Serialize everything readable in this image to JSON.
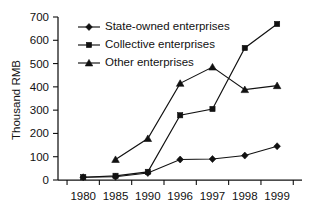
{
  "chart_data": {
    "type": "line",
    "title": "",
    "subtitle": "",
    "xlabel": "",
    "ylabel": "Thousand RMB",
    "categories": [
      "1980",
      "1985",
      "1990",
      "1996",
      "1997",
      "1998",
      "1999"
    ],
    "ylim": [
      0,
      700
    ],
    "yticks": [
      0,
      100,
      200,
      300,
      400,
      500,
      600,
      700
    ],
    "ytick_labels": [
      "0",
      "100",
      "200",
      "300",
      "400",
      "500",
      "600",
      "700"
    ],
    "grid": false,
    "legend_position": "top-left-inside",
    "series": [
      {
        "name": "State-owned enterprises",
        "marker": "diamond",
        "color": "#111111",
        "values": [
          12,
          14,
          30,
          88,
          90,
          105,
          145
        ]
      },
      {
        "name": "Collective enterprises",
        "marker": "square",
        "color": "#111111",
        "values": [
          12,
          18,
          35,
          278,
          305,
          567,
          670
        ]
      },
      {
        "name": "Other enterprises",
        "marker": "triangle",
        "color": "#111111",
        "values": [
          null,
          88,
          178,
          415,
          485,
          388,
          405
        ]
      }
    ]
  },
  "legend": {
    "entries": [
      {
        "label": "State-owned enterprises",
        "marker": "diamond"
      },
      {
        "label": "Collective enterprises",
        "marker": "square"
      },
      {
        "label": "Other enterprises",
        "marker": "triangle"
      }
    ]
  },
  "axes": {
    "y_axis_title": "Thousand RMB"
  }
}
